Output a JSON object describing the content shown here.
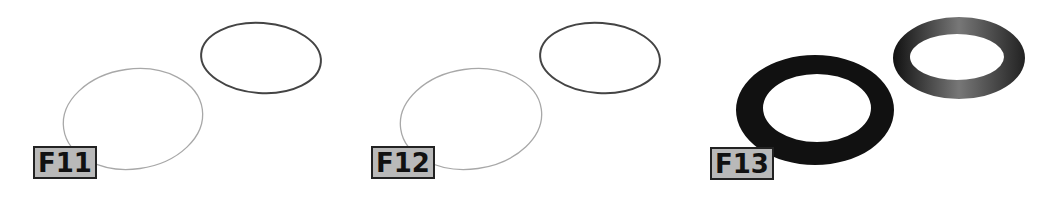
{
  "figure": {
    "panels": [
      {
        "id": "F11",
        "label": "F11",
        "description": "two ellipse outlines; left thin light stroke, right darker stroke"
      },
      {
        "id": "F12",
        "label": "F12",
        "description": "two ellipse outlines; left thin light stroke, right darker stroke"
      },
      {
        "id": "F13",
        "label": "F13",
        "description": "two solid rings; left thick dark ring, right beveled/conical ring"
      }
    ],
    "colors": {
      "light_stroke": "#a0a0a0",
      "dark_stroke": "#444444",
      "ring_dark": "#111111",
      "label_bg": "#b9b9b9",
      "label_border": "#222222"
    }
  }
}
